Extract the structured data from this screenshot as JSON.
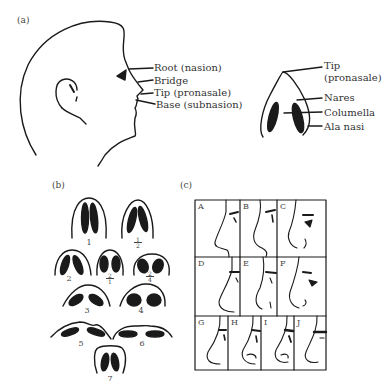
{
  "figure": {
    "panels": {
      "a": {
        "label": "(a)",
        "profile_labels": [
          {
            "id": "root",
            "text": "Root (nasion)"
          },
          {
            "id": "bridge",
            "text": "Bridge"
          },
          {
            "id": "tip",
            "text": "Tip (pronasale)"
          },
          {
            "id": "base",
            "text": "Base (subnasion)"
          }
        ],
        "base_view_labels": [
          {
            "id": "tip",
            "text_line1": "Tip",
            "text_line2": "(pronasale)"
          },
          {
            "id": "nares",
            "text": "Nares"
          },
          {
            "id": "columella",
            "text": "Columella"
          },
          {
            "id": "ala",
            "text": "Ala nasi"
          }
        ]
      },
      "b": {
        "label": "(b)",
        "nostril_types": [
          {
            "label": "1"
          },
          {
            "label_num": "1",
            "label_den": "2"
          },
          {
            "label": "2"
          },
          {
            "label_num": "2",
            "label_den": "1"
          },
          {
            "label_num": "2",
            "label_den": "4"
          },
          {
            "label": "3"
          },
          {
            "label": "4"
          },
          {
            "label": "5"
          },
          {
            "label": "6"
          },
          {
            "label": "7"
          }
        ]
      },
      "c": {
        "label": "(c)",
        "profile_cells": [
          "A",
          "B",
          "C",
          "D",
          "E",
          "F",
          "G",
          "H",
          "I",
          "J"
        ]
      }
    }
  }
}
